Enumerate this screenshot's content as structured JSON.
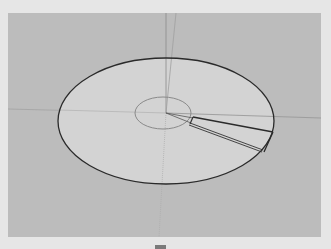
{
  "viewport": {
    "label": "3D model viewport",
    "background_color": "#bcbcbc",
    "frame_color": "#e6e6e6"
  },
  "model": {
    "type": "disc-with-wedge-cut",
    "face_color": "#d4d4d4",
    "edge_color": "#2a2a2a",
    "outer_ellipse": {
      "cx": 158,
      "cy": 108,
      "rx": 108,
      "ry": 63
    },
    "inner_ellipse": {
      "cx": 158,
      "cy": 100,
      "rx": 28,
      "ry": 16
    },
    "origin": {
      "x": 158,
      "y": 100
    }
  },
  "axes": {
    "red_axis_color": "#9a8a8a",
    "green_axis_color": "#9a9a9a",
    "blue_axis_color": "#8a8a9a"
  },
  "icons": {
    "status_tab": "tab-icon"
  }
}
